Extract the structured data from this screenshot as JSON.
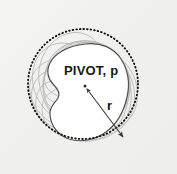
{
  "figure": {
    "background_color": "#f1f1ef",
    "labels": {
      "pivot": "PIVOT, p",
      "radius": "r"
    },
    "colors": {
      "outline": "#4a4a4a",
      "ghost_outline": "#b9b9b9",
      "dotted_circle": "#1a1a1a",
      "arrow": "#3a3a3a",
      "text": "#181818",
      "shape_fill": "#ffffff"
    },
    "geometry": {
      "pivot_point": {
        "x": 85,
        "y": 86
      },
      "bounding_circle": {
        "cx": 83,
        "cy": 84,
        "r": 55
      },
      "radius_arrow": {
        "x1": 86,
        "y1": 88,
        "x2": 124,
        "y2": 138
      },
      "ghost_rotations_deg": [
        -72,
        -54,
        -36,
        -18,
        18,
        36,
        54,
        72,
        108,
        144
      ]
    },
    "icons": {
      "pivot_dot": "pivot-point-dot",
      "arrow_head": "arrow-head-icon"
    }
  }
}
